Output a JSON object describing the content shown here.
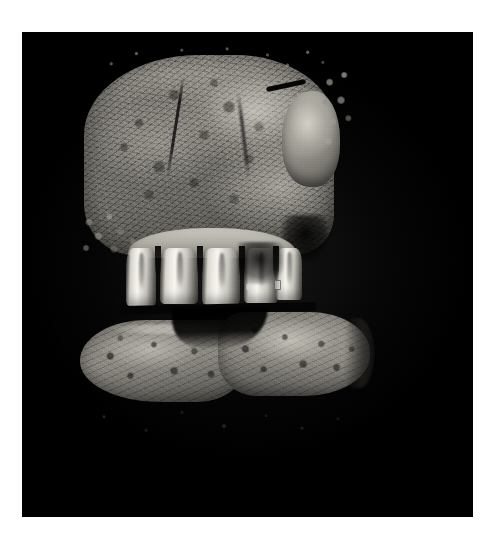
{
  "image": {
    "kind": "photograph",
    "subject": "anatomical-specimen-cross-section",
    "description": "Sagittal cross-section of an animal oral cavity showing the upper maxilla bone block with four exposed teeth and roots above, and an elongated lower mandible / tongue slab below, photographed against a plain black background.",
    "background_color": "#000000",
    "page_color": "#ffffff",
    "orientation": "portrait",
    "caption": ""
  },
  "plate": {
    "left": 22,
    "top": 32,
    "width": 451,
    "height": 485,
    "background_color": "#000000"
  },
  "regions": {
    "upper_block": {
      "label": "upper maxilla bone block",
      "tissue": "cancellous bone with trabecular marrow texture",
      "tone_light": "#c4c1ba",
      "tone_mid": "#8d8a83",
      "tone_dark": "#3b3a36"
    },
    "tuberosity": {
      "label": "bright rounded tuberosity at right edge",
      "tone": "#bcb9b1"
    },
    "notch": {
      "label": "dark linear notch cut into upper right edge",
      "tone": "#050505"
    },
    "palate_slot": {
      "label": "dark rectangular palate slot above tooth row",
      "tone": "#060606"
    },
    "alveolar_ridge": {
      "label": "alveolar ridge / gum line above teeth",
      "tone": "#cbc8c0"
    },
    "teeth": {
      "label": "tooth row",
      "count": 5,
      "enamel_tone": "#f8f6f0",
      "dentin_tone": "#cecbc4",
      "pulp_tone": "#34322f"
    },
    "decay": {
      "label": "dark decay / shadow between posterior teeth",
      "tone": "#000000"
    },
    "occlusal_line": {
      "label": "dark occlusal gap between upper and lower jaw",
      "tone": "#040404"
    },
    "lower_slab": {
      "label": "lower mandible and tongue slab",
      "tone_light": "#b6b3ab",
      "tone_mid": "#8e8b84",
      "tone_dark": "#43423f"
    },
    "sublingual_wedge": {
      "label": "dark sublingual wedge between lower lobes",
      "tone": "#000000"
    },
    "markings": {
      "label": "faint light specimen markings on tooth and lower slab",
      "count": 3,
      "tone": "#dcdad4",
      "legible": false
    },
    "fringe": {
      "label": "scattered bright tissue fragments along top margin",
      "tone": "#bebcb6"
    },
    "wisps": {
      "label": "faint tissue wisps below the lower slab",
      "tone": "#7a7874"
    }
  }
}
